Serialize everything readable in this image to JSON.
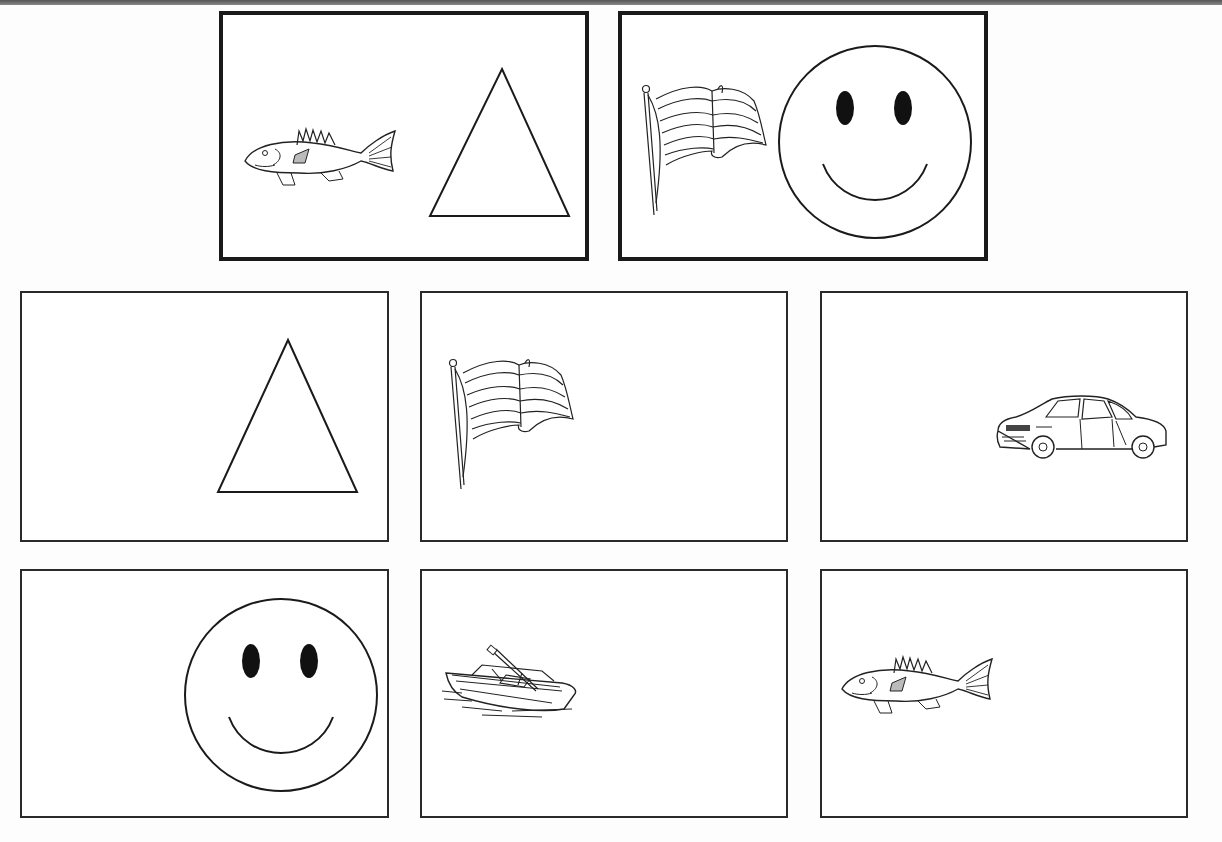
{
  "worksheet": {
    "sample_cards": [
      {
        "position": "top-left",
        "items": [
          "fish",
          "triangle"
        ]
      },
      {
        "position": "top-right",
        "items": [
          "flag",
          "smiley-face"
        ]
      }
    ],
    "choice_cards": [
      {
        "row": 1,
        "col": 1,
        "item": "triangle"
      },
      {
        "row": 1,
        "col": 2,
        "item": "flag"
      },
      {
        "row": 1,
        "col": 3,
        "item": "car"
      },
      {
        "row": 2,
        "col": 1,
        "item": "smiley-face"
      },
      {
        "row": 2,
        "col": 2,
        "item": "boat"
      },
      {
        "row": 2,
        "col": 3,
        "item": "fish"
      }
    ],
    "colors": {
      "line": "#1a1a1a",
      "background": "#ffffff",
      "top_band": "#666666"
    }
  }
}
